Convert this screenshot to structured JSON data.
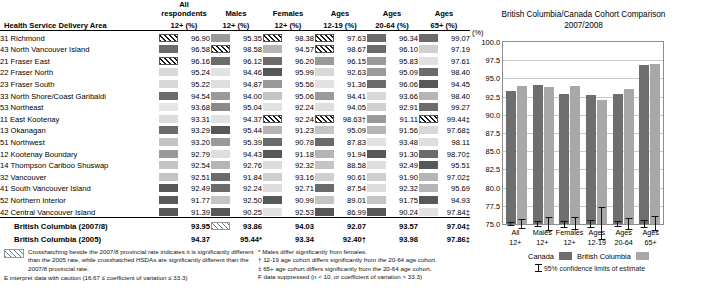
{
  "table": {
    "header_top": [
      "",
      "All respondents",
      "Males",
      "Females",
      "Ages",
      "Ages",
      "Ages"
    ],
    "header_bottom": [
      "Health Service Delivery Area",
      "12+ (%)",
      "12+ (%)",
      "12+ (%)",
      "12-19 (%)",
      "20-64 (%)",
      "65+ (%)"
    ],
    "rows": [
      {
        "area": "31 Richmond",
        "v": [
          {
            "n": "96.90",
            "s": "hatch"
          },
          {
            "n": "95.35",
            "s": "#9a9a9a"
          },
          {
            "n": "98.38",
            "s": "hatch"
          },
          {
            "n": "97.63",
            "s": "hatch"
          },
          {
            "n": "96.34",
            "s": "#6b6b6b"
          },
          {
            "n": "99.07",
            "s": "#6b6b6b"
          }
        ]
      },
      {
        "area": "43 North Vancouver Island",
        "v": [
          {
            "n": "96.58",
            "s": "#6b6b6b"
          },
          {
            "n": "98.58",
            "s": "hatch"
          },
          {
            "n": "94.57",
            "s": "#b5b5b5"
          },
          {
            "n": "98.67",
            "s": "hatch"
          },
          {
            "n": "96.10",
            "s": "#6b6b6b"
          },
          {
            "n": "97.19",
            "s": "#cfcfcf"
          }
        ]
      },
      {
        "area": "21 Fraser East",
        "v": [
          {
            "n": "96.16",
            "s": "hatch"
          },
          {
            "n": "96.12",
            "s": "#6b6b6b"
          },
          {
            "n": "96.20",
            "s": "#6b6b6b"
          },
          {
            "n": "96.15",
            "s": "#9a9a9a"
          },
          {
            "n": "95.83",
            "s": "#9a9a9a"
          },
          {
            "n": "97.61",
            "s": "#e0e0e0"
          }
        ]
      },
      {
        "area": "22 Fraser North",
        "v": [
          {
            "n": "95.24",
            "s": "#d8d8d8"
          },
          {
            "n": "94.46",
            "s": "#e2e2e2"
          },
          {
            "n": "95.99",
            "s": "#575757"
          },
          {
            "n": "92.63",
            "s": "#d8d8d8"
          },
          {
            "n": "95.09",
            "s": "#9a9a9a"
          },
          {
            "n": "98.40",
            "s": "#6b6b6b"
          }
        ]
      },
      {
        "area": "23 Fraser South",
        "v": [
          {
            "n": "95.22",
            "s": "#d8d8d8"
          },
          {
            "n": "94.87",
            "s": "#dedede"
          },
          {
            "n": "95.56",
            "s": "#9a9a9a"
          },
          {
            "n": "91.36",
            "s": "#e2e2e2"
          },
          {
            "n": "96.06",
            "s": "#6b6b6b"
          },
          {
            "n": "94.45",
            "s": "#575757"
          }
        ]
      },
      {
        "area": "33 North Shore/Coast Garibaldi",
        "v": [
          {
            "n": "94.54",
            "s": "#6b6b6b"
          },
          {
            "n": "94.00",
            "s": "#9a9a9a"
          },
          {
            "n": "95.06",
            "s": "#c4c4c4"
          },
          {
            "n": "94.41",
            "s": "#9a9a9a"
          },
          {
            "n": "93.66",
            "s": "#d8d8d8"
          },
          {
            "n": "98.40",
            "s": "#b5b5b5"
          }
        ]
      },
      {
        "area": "53 Northeast",
        "v": [
          {
            "n": "93.68",
            "s": "#e6e6e6"
          },
          {
            "n": "95.04",
            "s": "#8a8a8a"
          },
          {
            "n": "92.24",
            "s": "#e2e2e2"
          },
          {
            "n": "94.05",
            "s": "#dedede"
          },
          {
            "n": "92.91",
            "s": "#d0d0d0"
          },
          {
            "n": "99.27",
            "s": "#6b6b6b"
          }
        ]
      },
      {
        "area": "11 East Kootenay",
        "v": [
          {
            "n": "93.31",
            "s": "#dcdcdc"
          },
          {
            "n": "94.37",
            "s": "#e2e2e2"
          },
          {
            "n": "92.24",
            "s": "hatch"
          },
          {
            "n": "98.63",
            "s": "hatch",
            "sup": "†"
          },
          {
            "n": "91.11",
            "s": "#9a9a9a"
          },
          {
            "n": "99.44",
            "s": "hatch",
            "sup": "‡"
          }
        ]
      },
      {
        "area": "13 Okanagan",
        "v": [
          {
            "n": "93.29",
            "s": "#6b6b6b"
          },
          {
            "n": "95.44",
            "s": "#575757"
          },
          {
            "n": "91.23",
            "s": "#b5b5b5"
          },
          {
            "n": "95.09",
            "s": "#c4c4c4"
          },
          {
            "n": "91.56",
            "s": "#b5b5b5"
          },
          {
            "n": "97.68",
            "s": "#d8d8d8",
            "sup": "‡"
          }
        ]
      },
      {
        "area": "51 Northwest",
        "v": [
          {
            "n": "93.20",
            "s": "#c4c4c4"
          },
          {
            "n": "95.39",
            "s": "#9a9a9a"
          },
          {
            "n": "90.78",
            "s": "#6b6b6b"
          },
          {
            "n": "87.83",
            "s": "#6b6b6b"
          },
          {
            "n": "93.48",
            "s": "#e2e2e2"
          },
          {
            "n": "98.11",
            "s": "#dedede"
          }
        ]
      },
      {
        "area": "12 Kootenay Boundary",
        "v": [
          {
            "n": "92.79",
            "s": "#9a9a9a"
          },
          {
            "n": "94.43",
            "s": "#dedede"
          },
          {
            "n": "91.18",
            "s": "#575757"
          },
          {
            "n": "91.94",
            "s": "#b5b5b5"
          },
          {
            "n": "91.30",
            "s": "#575757"
          },
          {
            "n": "98.70",
            "s": "#6b6b6b",
            "sup": "‡"
          }
        ]
      },
      {
        "area": "14 Thompson Cariboo Shuswap",
        "v": [
          {
            "n": "92.54",
            "s": "#c4c4c4"
          },
          {
            "n": "92.76",
            "s": "#b5b5b5"
          },
          {
            "n": "92.32",
            "s": "#dcdcdc"
          },
          {
            "n": "88.58",
            "s": "#c4c4c4"
          },
          {
            "n": "92.49",
            "s": "#dedede"
          },
          {
            "n": "95.51",
            "s": "#575757"
          }
        ]
      },
      {
        "area": "32 Vancouver",
        "v": [
          {
            "n": "92.51",
            "s": "#c4c4c4"
          },
          {
            "n": "91.84",
            "s": "#6b6b6b"
          },
          {
            "n": "93.16",
            "s": "#cfcfcf"
          },
          {
            "n": "90.61",
            "s": "#cfcfcf"
          },
          {
            "n": "91.90",
            "s": "#cfcfcf"
          },
          {
            "n": "97.02",
            "s": "#b5b5b5",
            "sup": "‡"
          }
        ]
      },
      {
        "area": "41 South Vancouver Island",
        "v": [
          {
            "n": "92.49",
            "s": "#575757"
          },
          {
            "n": "92.24",
            "s": "#6b6b6b"
          },
          {
            "n": "92.71",
            "s": "#dcdcdc"
          },
          {
            "n": "87.54",
            "s": "#6b6b6b"
          },
          {
            "n": "92.32",
            "s": "#dcdcdc"
          },
          {
            "n": "95.69",
            "s": "#b5b5b5"
          }
        ]
      },
      {
        "area": "52 Northern Interior",
        "v": [
          {
            "n": "91.77",
            "s": "#575757"
          },
          {
            "n": "92.50",
            "s": "#c4c4c4"
          },
          {
            "n": "90.99",
            "s": "#575757"
          },
          {
            "n": "89.01",
            "s": "#c4c4c4"
          },
          {
            "n": "91.75",
            "s": "#c4c4c4"
          },
          {
            "n": "94.93",
            "s": "#575757"
          }
        ]
      },
      {
        "area": "42 Central Vancouver Island",
        "v": [
          {
            "n": "91.39",
            "s": "#575757"
          },
          {
            "n": "90.25",
            "s": "#575757"
          },
          {
            "n": "92.53",
            "s": "#e2e2e2"
          },
          {
            "n": "86.99",
            "s": "#575757"
          },
          {
            "n": "90.24",
            "s": "#575757"
          },
          {
            "n": "97.84",
            "s": "#e2e2e2",
            "sup": "‡"
          }
        ]
      }
    ],
    "summary": [
      {
        "label": "British Columbia (2007/8)",
        "v": [
          {
            "n": "93.95"
          },
          {
            "n": "93.86",
            "s": "hatch-light"
          },
          {
            "n": "94.03"
          },
          {
            "n": "92.07"
          },
          {
            "n": "93.57"
          },
          {
            "n": "97.04",
            "sup": "‡"
          }
        ]
      },
      {
        "label": "British Columbia (2005)",
        "v": [
          {
            "n": "94.37"
          },
          {
            "n": "95.44",
            "sup": "*"
          },
          {
            "n": "93.34"
          },
          {
            "n": "92.40",
            "sup": "†"
          },
          {
            "n": "93.98"
          },
          {
            "n": "97.86",
            "sup": "‡"
          }
        ]
      }
    ]
  },
  "footnotes": {
    "left": [
      "Crosshatching beside the 2007/8 provincial rate indicates it is significantly different than the 2005 rate, while crosshatched HSDAs are significantly different than the 2007/8 provincial rate.",
      "E interpret data with caution (16.67 ≤ coefficient of variation ≤ 33.3)"
    ],
    "right": [
      "* Males differ significantly from females.",
      "† 12-19 age cohort differs significantly from the 20-64 age cohort.",
      "‡ 65+ age cohort differs significantly from the 20-64 age cohort.",
      "F data suppressed (n < 10, or coefficient of variation > 33.3)"
    ]
  },
  "chart_data": {
    "type": "bar",
    "title": "British Columbia/Canada Cohort Comparison",
    "subtitle": "2007/2008",
    "ylabel": "(%)",
    "xlabel": "",
    "ylim": [
      75.0,
      100.0
    ],
    "yticks": [
      "100.0",
      "97.5",
      "95.0",
      "92.5",
      "90.0",
      "87.5",
      "85.0",
      "82.5",
      "80.0",
      "77.5",
      "75.0"
    ],
    "grid": true,
    "legend_position": "bottom",
    "categories": [
      "All\n12+",
      "Males\n12+",
      "Females\n12+",
      "Ages\n12-19",
      "Ages\n20-64",
      "Ages\n65+"
    ],
    "category_labels": [
      {
        "l1": "All",
        "l2": "12+"
      },
      {
        "l1": "Males",
        "l2": "12+"
      },
      {
        "l1": "Females",
        "l2": "12+"
      },
      {
        "l1": "Ages",
        "l2": "12-19"
      },
      {
        "l1": "Ages",
        "l2": "20-64"
      },
      {
        "l1": "Ages",
        "l2": "65+"
      }
    ],
    "series": [
      {
        "name": "Canada",
        "color": "#6e6e6e",
        "values": [
          93.3,
          94.1,
          92.9,
          92.7,
          92.9,
          96.9
        ],
        "ci_low": [
          93.0,
          93.7,
          92.4,
          92.1,
          92.5,
          96.4
        ],
        "ci_high": [
          93.6,
          94.5,
          93.3,
          93.3,
          93.3,
          97.4
        ]
      },
      {
        "name": "British Columbia",
        "color": "#a8a8a8",
        "values": [
          93.9,
          93.8,
          94.0,
          92.1,
          93.6,
          97.0
        ],
        "ci_low": [
          93.2,
          92.8,
          93.2,
          89.9,
          92.8,
          96.0
        ],
        "ci_high": [
          94.6,
          94.8,
          94.9,
          94.4,
          94.4,
          98.1
        ]
      }
    ],
    "legend": [
      {
        "label": "Canada",
        "color": "#6e6e6e"
      },
      {
        "label": "British Columbia",
        "color": "#a8a8a8"
      }
    ],
    "ci_note": "95% confidence limits of estimate"
  }
}
